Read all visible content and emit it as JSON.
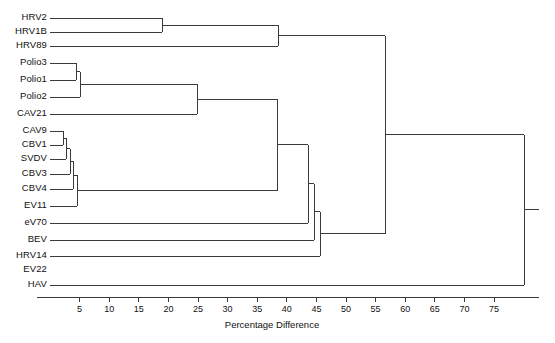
{
  "figure": {
    "type": "dendrogram",
    "width": 555,
    "height": 343,
    "background": "#ffffff",
    "line_color": "#3a3a3a"
  },
  "axis": {
    "title": "Percentage Difference",
    "min": 0,
    "max": 75,
    "tick_step": 5,
    "ticks": [
      5,
      10,
      15,
      20,
      25,
      30,
      35,
      40,
      45,
      50,
      55,
      60,
      65,
      70,
      75
    ],
    "tick_labels": [
      "5",
      "10",
      "15",
      "20",
      "25",
      "30",
      "35",
      "40",
      "45",
      "50",
      "55",
      "60",
      "65",
      "70",
      "75"
    ],
    "orientation": "bottom",
    "direction": "left-to-right",
    "grid": false,
    "axis_pixel_x0": 50,
    "axis_pixel_x75": 494,
    "axis_pixel_y": 297,
    "axis_line_end_x": 539
  },
  "chart_data": {
    "type": "dendrogram",
    "title": "",
    "xlabel": "Percentage Difference",
    "ylabel": "",
    "xlim": [
      0,
      75
    ],
    "grid": false,
    "legend": "none",
    "orientation": "horizontal",
    "leaf_order": [
      "HRV2",
      "HRV1B",
      "HRV89",
      "Polio3",
      "Polio1",
      "Polio2",
      "CAV21",
      "CAV9",
      "CBV1",
      "SVDV",
      "CBV3",
      "CBV4",
      "EV11",
      "eV70",
      "BEV",
      "HRV14",
      "EV22",
      "HAV"
    ],
    "leaves": [
      {
        "label": "HRV2",
        "row": 0,
        "y": 18,
        "branch_drawn": true
      },
      {
        "label": "HRV1B",
        "row": 1,
        "y": 32,
        "branch_drawn": true
      },
      {
        "label": "HRV89",
        "row": 2,
        "y": 46,
        "branch_drawn": true
      },
      {
        "label": "Polio3",
        "row": 3,
        "y": 63,
        "branch_drawn": true
      },
      {
        "label": "Polio1",
        "row": 4,
        "y": 80,
        "branch_drawn": true
      },
      {
        "label": "Polio2",
        "row": 5,
        "y": 97,
        "branch_drawn": true
      },
      {
        "label": "CAV21",
        "row": 6,
        "y": 114,
        "branch_drawn": true
      },
      {
        "label": "CAV9",
        "row": 7,
        "y": 131,
        "branch_drawn": true
      },
      {
        "label": "CBV1",
        "row": 8,
        "y": 145,
        "branch_drawn": true
      },
      {
        "label": "SVDV",
        "row": 9,
        "y": 159,
        "branch_drawn": true
      },
      {
        "label": "CBV3",
        "row": 10,
        "y": 174,
        "branch_drawn": true
      },
      {
        "label": "CBV4",
        "row": 11,
        "y": 189,
        "branch_drawn": true
      },
      {
        "label": "EV11",
        "row": 12,
        "y": 206,
        "branch_drawn": true
      },
      {
        "label": "eV70",
        "row": 13,
        "y": 223,
        "branch_drawn": true
      },
      {
        "label": "BEV",
        "row": 14,
        "y": 240,
        "branch_drawn": true
      },
      {
        "label": "HRV14",
        "row": 15,
        "y": 256,
        "branch_drawn": true
      },
      {
        "label": "EV22",
        "row": 16,
        "y": 270,
        "branch_drawn": false
      },
      {
        "label": "HAV",
        "row": 17,
        "y": 285,
        "branch_drawn": true
      }
    ],
    "merges": [
      {
        "id": "n1",
        "members": [
          "HRV2",
          "HRV1B"
        ],
        "distance": 19.0,
        "pixel_x": 162,
        "y_top": 18,
        "y_bottom": 32
      },
      {
        "id": "n2",
        "members": [
          "n1",
          "HRV89"
        ],
        "distance": 38.5,
        "pixel_x": 278,
        "y_top": 25,
        "y_bottom": 46
      },
      {
        "id": "n3",
        "members": [
          "Polio3",
          "Polio1"
        ],
        "distance": 4.4,
        "pixel_x": 76,
        "y_top": 63,
        "y_bottom": 80
      },
      {
        "id": "n4",
        "members": [
          "n3",
          "Polio2"
        ],
        "distance": 5.1,
        "pixel_x": 80,
        "y_top": 71,
        "y_bottom": 97
      },
      {
        "id": "n5",
        "members": [
          "n4",
          "CAV21"
        ],
        "distance": 22.6,
        "pixel_x": 197,
        "y_top": 84,
        "y_bottom": 114
      },
      {
        "id": "n6",
        "members": [
          "CAV9",
          "CBV1"
        ],
        "distance": 2.2,
        "pixel_x": 63,
        "y_top": 131,
        "y_bottom": 145
      },
      {
        "id": "n7",
        "members": [
          "n6",
          "SVDV"
        ],
        "distance": 2.7,
        "pixel_x": 66,
        "y_top": 138,
        "y_bottom": 159
      },
      {
        "id": "n8",
        "members": [
          "n7",
          "CBV3"
        ],
        "distance": 3.4,
        "pixel_x": 70,
        "y_top": 148,
        "y_bottom": 174
      },
      {
        "id": "n9",
        "members": [
          "n8",
          "CBV4"
        ],
        "distance": 3.9,
        "pixel_x": 73,
        "y_top": 161,
        "y_bottom": 189
      },
      {
        "id": "n10",
        "members": [
          "n9",
          "EV11"
        ],
        "distance": 4.6,
        "pixel_x": 77,
        "y_top": 175,
        "y_bottom": 206
      },
      {
        "id": "n11",
        "members": [
          "n10",
          "n5"
        ],
        "distance": 35.0,
        "pixel_x": 277,
        "y_top": 99,
        "y_bottom": 190
      },
      {
        "id": "n12",
        "members": [
          "n11",
          "eV70"
        ],
        "distance": 39.0,
        "pixel_x": 308,
        "y_top": 145,
        "y_bottom": 223
      },
      {
        "id": "n13",
        "members": [
          "n12",
          "BEV"
        ],
        "distance": 40.0,
        "pixel_x": 314,
        "y_top": 184,
        "y_bottom": 240
      },
      {
        "id": "n14",
        "members": [
          "n13",
          "HRV14"
        ],
        "distance": 40.5,
        "pixel_x": 320,
        "y_top": 212,
        "y_bottom": 256
      },
      {
        "id": "n15",
        "members": [
          "n2",
          "n14"
        ],
        "distance": 51.0,
        "pixel_x": 385,
        "y_top": 35,
        "y_bottom": 234
      },
      {
        "id": "root",
        "members": [
          "n15",
          "HAV"
        ],
        "distance": 73.5,
        "pixel_x": 524,
        "y_top": 135,
        "y_bottom": 285
      }
    ]
  },
  "labels": {
    "left_label_right_edge": 47,
    "font_size_px": 9.5
  }
}
